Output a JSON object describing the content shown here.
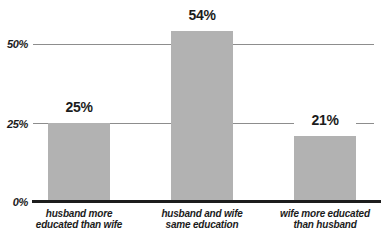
{
  "chart_data": {
    "type": "bar",
    "title": "",
    "xlabel": "",
    "ylabel": "",
    "categories": [
      "husband more\neducated than wife",
      "husband and wife\nsame education",
      "wife more educated\nthan husband"
    ],
    "values": [
      25,
      54,
      21
    ],
    "value_labels": [
      "25%",
      "54%",
      "21%"
    ],
    "y_ticks": [
      {
        "value": 0,
        "label": "0%"
      },
      {
        "value": 25,
        "label": "25%"
      },
      {
        "value": 50,
        "label": "50%"
      }
    ],
    "ylim": [
      0,
      58
    ],
    "grid": "horizontal gridlines at 25 and 50",
    "legend": "none",
    "colors": {
      "bar": "#b2b2b2",
      "gridline": "#8d8d8d",
      "baseline": "#1d1d1d",
      "text": "#1c1c1c",
      "background": "#ffffff"
    }
  }
}
